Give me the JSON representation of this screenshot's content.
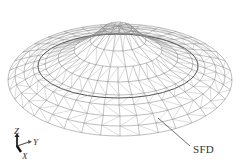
{
  "figure": {
    "type": "wireframe-lattice-dome",
    "annotation": {
      "text": "SFD",
      "leader_to": "lower ring / damper members"
    },
    "axes": {
      "z": "Z",
      "y": "Y",
      "x": "X"
    },
    "colors": {
      "line": "#6b6b6b",
      "line_dark": "#3a3a3a",
      "background": "#ffffff"
    },
    "geometry": {
      "outer_ellipse": {
        "cx": 120,
        "cy": 78,
        "rx": 112,
        "ry": 58
      },
      "inner_ring": {
        "cx": 118,
        "cy": 68,
        "rx": 80,
        "ry": 30
      },
      "apex": {
        "x": 118,
        "y": 12
      }
    }
  }
}
